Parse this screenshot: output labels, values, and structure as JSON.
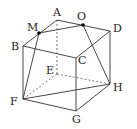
{
  "diagram": {
    "type": "cube",
    "labels": {
      "A": "A",
      "B": "B",
      "C": "C",
      "D": "D",
      "E": "E",
      "F": "F",
      "G": "G",
      "H": "H",
      "M": "M",
      "O": "O"
    },
    "colors": {
      "line": "#333333",
      "dot": "#000000"
    }
  }
}
